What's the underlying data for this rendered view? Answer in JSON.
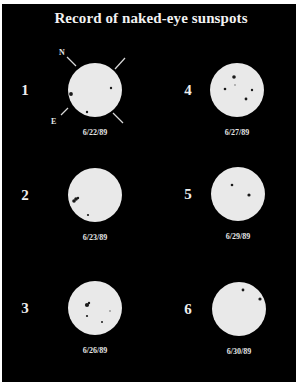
{
  "title": "Record of naked-eye sunspots",
  "colors": {
    "background": "#000000",
    "border": "#ffffff",
    "disk": "#e9e9e9",
    "spot": "#1a1a1a",
    "text": "#eeeeee"
  },
  "orientation": {
    "disk_index": 0,
    "north_label": "N",
    "east_label": "E"
  },
  "panels": [
    {
      "number": "1",
      "date": "6/22/89",
      "center": [
        95,
        90
      ],
      "radius": 27,
      "spots": [
        {
          "x": 71,
          "y": 94,
          "r": 1.9
        },
        {
          "x": 111,
          "y": 88,
          "r": 1.2
        },
        {
          "x": 87,
          "y": 112,
          "r": 1.2
        }
      ]
    },
    {
      "number": "2",
      "date": "6/23/89",
      "center": [
        95,
        195
      ],
      "radius": 27,
      "spots": [
        {
          "x": 74,
          "y": 201,
          "r": 1.8
        },
        {
          "x": 76,
          "y": 199,
          "r": 1.8
        },
        {
          "x": 78,
          "y": 198,
          "r": 1.2
        },
        {
          "x": 88,
          "y": 215,
          "r": 1.1
        }
      ]
    },
    {
      "number": "3",
      "date": "6/26/89",
      "center": [
        95,
        308
      ],
      "radius": 27,
      "spots": [
        {
          "x": 87,
          "y": 305,
          "r": 2.1
        },
        {
          "x": 89,
          "y": 303,
          "r": 1.2
        },
        {
          "x": 87,
          "y": 316,
          "r": 1.1
        },
        {
          "x": 102,
          "y": 322,
          "r": 1.0
        },
        {
          "x": 110,
          "y": 311,
          "r": 1.0,
          "faint": true
        }
      ]
    },
    {
      "number": "4",
      "date": "6/27/89",
      "center": [
        237,
        90
      ],
      "radius": 27,
      "spots": [
        {
          "x": 234,
          "y": 77,
          "r": 1.8
        },
        {
          "x": 225,
          "y": 89,
          "r": 1.3
        },
        {
          "x": 252,
          "y": 90,
          "r": 1.2
        },
        {
          "x": 246,
          "y": 99,
          "r": 1.4
        },
        {
          "x": 235,
          "y": 85,
          "r": 0.9,
          "faint": true
        }
      ]
    },
    {
      "number": "5",
      "date": "6/29/89",
      "center": [
        238,
        194
      ],
      "radius": 27,
      "spots": [
        {
          "x": 232,
          "y": 185,
          "r": 1.3
        },
        {
          "x": 249,
          "y": 195,
          "r": 1.6
        }
      ]
    },
    {
      "number": "6",
      "date": "6/30/89",
      "center": [
        239,
        309
      ],
      "radius": 27,
      "spots": [
        {
          "x": 243,
          "y": 290,
          "r": 1.4
        },
        {
          "x": 260,
          "y": 299,
          "r": 1.6
        }
      ]
    }
  ],
  "layout": {
    "number_x_left": 25,
    "number_x_right": 188,
    "date_offset_y": 42
  }
}
